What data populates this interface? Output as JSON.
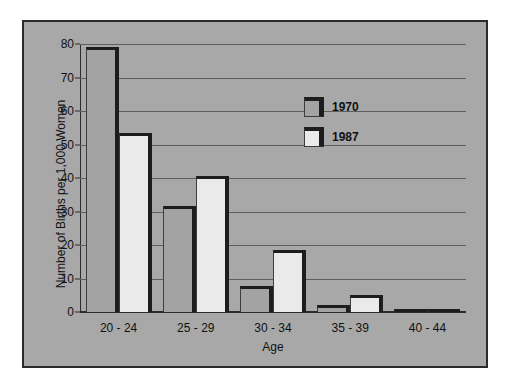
{
  "chart_data": {
    "type": "bar",
    "title": "",
    "xlabel": "Age",
    "ylabel": "Number of Births per 1,000 Women",
    "categories": [
      "20 - 24",
      "25 - 29",
      "30 - 34",
      "35 - 39",
      "40 - 44"
    ],
    "series": [
      {
        "name": "1970",
        "values": [
          79,
          31.5,
          7.8,
          2.2,
          0.8
        ]
      },
      {
        "name": "1987",
        "values": [
          53.5,
          40.5,
          18.5,
          5,
          1
        ]
      }
    ],
    "ylim": [
      0,
      80
    ],
    "yticks": [
      0,
      10,
      20,
      30,
      40,
      50,
      60,
      70,
      80
    ],
    "ytick_labels": [
      "0",
      "10",
      "20",
      "30",
      "40",
      "50",
      "60",
      "70",
      "80"
    ],
    "grid": true,
    "legend_position": "inside-upper-right",
    "colors": {
      "panel_background": "#a8a8a8",
      "page_background": "#ffffff",
      "frame": "#2a2a2a",
      "gridline": "#5e5e5e",
      "axis": "#2a2a2a",
      "bar_outline": "#1d1d1d",
      "series_1970_fill": "#a3a3a3",
      "series_1987_fill": "#eaeaea",
      "text": "#111111"
    }
  }
}
